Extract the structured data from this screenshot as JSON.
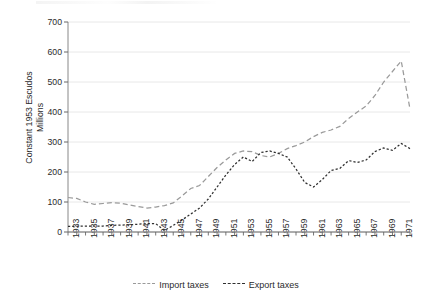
{
  "chart_data": {
    "type": "line",
    "title": "",
    "xlabel": "",
    "ylabel": "Constant 1953 Escudos Millions",
    "ylabel_lines": [
      "Constant 1953 Escudos",
      "Millions"
    ],
    "ylim": [
      0,
      700
    ],
    "ytick_step": 100,
    "yticks": [
      0,
      100,
      200,
      300,
      400,
      500,
      600,
      700
    ],
    "xlim": [
      1933,
      1972
    ],
    "xtick_step": 2,
    "xticks": [
      1933,
      1935,
      1937,
      1939,
      1941,
      1943,
      1945,
      1947,
      1949,
      1951,
      1953,
      1955,
      1957,
      1959,
      1961,
      1963,
      1965,
      1967,
      1969,
      1971
    ],
    "grid": "horizontal",
    "legend_position": "bottom",
    "x": [
      1933,
      1934,
      1935,
      1936,
      1937,
      1938,
      1939,
      1940,
      1941,
      1942,
      1943,
      1944,
      1945,
      1946,
      1947,
      1948,
      1949,
      1950,
      1951,
      1952,
      1953,
      1954,
      1955,
      1956,
      1957,
      1958,
      1959,
      1960,
      1961,
      1962,
      1963,
      1964,
      1965,
      1966,
      1967,
      1968,
      1969,
      1970,
      1971,
      1972
    ],
    "series": [
      {
        "name": "Import taxes",
        "color": "#9a9a9a",
        "dash": "long",
        "values": [
          115,
          112,
          100,
          92,
          95,
          98,
          96,
          90,
          85,
          80,
          83,
          88,
          97,
          120,
          145,
          155,
          185,
          215,
          240,
          262,
          270,
          268,
          255,
          250,
          262,
          278,
          288,
          300,
          318,
          332,
          340,
          352,
          378,
          400,
          420,
          455,
          500,
          535,
          570,
          410
        ]
      },
      {
        "name": "Export taxes",
        "color": "#2f2f2f",
        "dash": "short",
        "values": [
          19,
          19,
          20,
          20,
          20,
          22,
          23,
          24,
          26,
          28,
          28,
          5,
          22,
          40,
          60,
          80,
          110,
          150,
          190,
          225,
          250,
          235,
          265,
          270,
          262,
          250,
          210,
          165,
          150,
          175,
          205,
          212,
          238,
          232,
          240,
          268,
          280,
          272,
          295,
          278
        ]
      }
    ]
  },
  "legend": {
    "items": [
      {
        "label": "Import taxes",
        "dash": "long",
        "color": "#9a9a9a"
      },
      {
        "label": "Export taxes",
        "dash": "short",
        "color": "#2f2f2f"
      }
    ]
  }
}
